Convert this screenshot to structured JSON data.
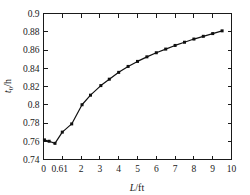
{
  "chart_data": {
    "type": "line",
    "title": "",
    "subtitle": "",
    "xlabel": "L/ft",
    "xlabel_italic_part": "L",
    "xlabel_rest": "/ft",
    "ylabel": "t0/h",
    "ylabel_base": "t",
    "ylabel_sub": "0",
    "ylabel_rest": "/h",
    "xlim": [
      0,
      10
    ],
    "ylim": [
      0.74,
      0.9
    ],
    "xticks": [
      0,
      1,
      2,
      3,
      4,
      5,
      6,
      7,
      8,
      9,
      10
    ],
    "xticklabels": [
      "0",
      "0.61",
      "2",
      "3",
      "4",
      "5",
      "6",
      "7",
      "8",
      "9",
      "10"
    ],
    "yticks": [
      0.74,
      0.76,
      0.78,
      0.8,
      0.82,
      0.84,
      0.86,
      0.88,
      0.9
    ],
    "yticklabels": [
      "0.74",
      "0.76",
      "0.78",
      "0.8",
      "0.82",
      "0.84",
      "0.86",
      "0.88",
      "0.9"
    ],
    "grid": false,
    "legend": null,
    "marker": "square",
    "line_color": "#101010",
    "marker_color": "#101010",
    "series": [
      {
        "name": "t0/h vs L",
        "x": [
          0.05,
          0.3,
          0.61,
          1.0,
          1.5,
          2.05,
          2.5,
          3.05,
          3.5,
          4.0,
          4.5,
          5.0,
          5.5,
          6.0,
          6.5,
          7.0,
          7.5,
          8.0,
          8.5,
          9.0,
          9.5
        ],
        "values": [
          0.7615,
          0.76,
          0.7577,
          0.77,
          0.779,
          0.8,
          0.8105,
          0.821,
          0.828,
          0.8355,
          0.842,
          0.8475,
          0.8525,
          0.857,
          0.861,
          0.865,
          0.8685,
          0.872,
          0.875,
          0.878,
          0.881
        ]
      }
    ]
  }
}
